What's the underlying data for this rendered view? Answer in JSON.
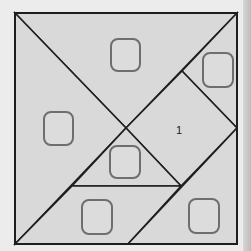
{
  "puzzle": {
    "type": "tangram",
    "frame": {
      "x1": 15,
      "y1": 13,
      "x2": 237,
      "y2": 244
    },
    "colors": {
      "fill": "#d9d9d9",
      "line": "#1e1e1e",
      "slot_stroke": "#6e6e6e",
      "background": "#ececec"
    },
    "pieces": [
      {
        "name": "large-triangle-top",
        "points": "15,13 237,13 126,128"
      },
      {
        "name": "large-triangle-left",
        "points": "15,13 126,128 15,244"
      },
      {
        "name": "small-triangle-top-right",
        "points": "237,13 182,71 237,128"
      },
      {
        "name": "square-piece",
        "points": "182,71 237,128 181,186 126,128"
      },
      {
        "name": "small-triangle-middle",
        "points": "126,128 181,186 72,186"
      },
      {
        "name": "parallelogram",
        "points": "72,186 181,186 128,244 15,244"
      },
      {
        "name": "medium-triangle-bottom-right",
        "points": "237,128 237,244 128,244"
      }
    ],
    "slots": [
      {
        "name": "slot-top",
        "x": 111,
        "y": 39,
        "w": 29,
        "h": 32
      },
      {
        "name": "slot-left",
        "x": 44,
        "y": 112,
        "w": 29,
        "h": 33
      },
      {
        "name": "slot-top-right",
        "x": 203,
        "y": 53,
        "w": 30,
        "h": 34
      },
      {
        "name": "slot-middle",
        "x": 110,
        "y": 146,
        "w": 30,
        "h": 32
      },
      {
        "name": "slot-bottom-left",
        "x": 82,
        "y": 200,
        "w": 30,
        "h": 34
      },
      {
        "name": "slot-bottom-right",
        "x": 189,
        "y": 199,
        "w": 30,
        "h": 34
      }
    ],
    "labels": [
      {
        "name": "piece-number-label",
        "text": "1",
        "x": 176,
        "y": 134
      }
    ]
  }
}
